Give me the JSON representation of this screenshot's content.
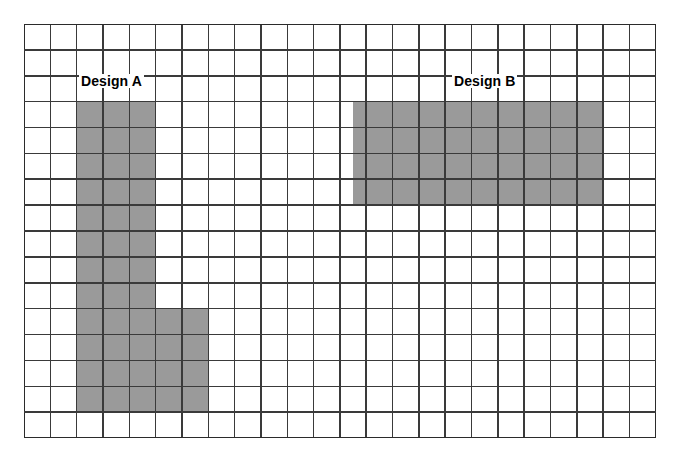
{
  "figure": {
    "background_color": "#ffffff"
  },
  "grid": {
    "columns": 24,
    "rows": 16,
    "cell_width": 26.33,
    "cell_height": 25.88,
    "origin_x": 24,
    "origin_y": 24,
    "line_color": "#3a3a3a",
    "line_width": 1.6,
    "border_color": "#2b2b2b",
    "border_width": 2
  },
  "labels": {
    "design_a": "Design A",
    "design_b": "Design B"
  },
  "chart_data": {
    "type": "heatmap",
    "xlabel": "",
    "ylabel": "",
    "grid": true,
    "legend_position": "none",
    "columns": 24,
    "rows": 16,
    "fill_color": "#9a9a9a",
    "empty_color": "#ffffff",
    "shapes": [
      {
        "name": "Design A",
        "label": "Design A",
        "fill": "#9a9a9a",
        "cell_count": 44,
        "blocks": [
          {
            "col": 2,
            "row": 3,
            "width": 3,
            "height": 8
          },
          {
            "col": 2,
            "row": 11,
            "width": 5,
            "height": 4
          }
        ]
      },
      {
        "name": "Design B",
        "label": "Design B",
        "fill": "#9a9a9a",
        "cell_count": 38,
        "blocks": [
          {
            "col": 12.5,
            "row": 3,
            "width": 9.5,
            "height": 4
          }
        ]
      }
    ]
  }
}
